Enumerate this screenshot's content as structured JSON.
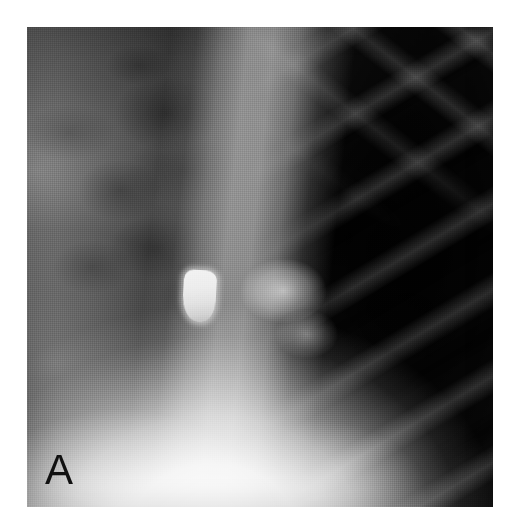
{
  "figure": {
    "type": "radiograph",
    "modality": "chest-x-ray",
    "panel_label": "A",
    "colorspace": "grayscale"
  },
  "canvas": {
    "width": 515,
    "height": 532,
    "background_color": "#ffffff"
  },
  "plate": {
    "x": 27,
    "y": 27,
    "width": 466,
    "height": 480,
    "border_color": "#ffffff"
  },
  "regions": [
    {
      "name": "left-hemithorax-field",
      "description": "mid-gray lung field with mottled pulmonary markings",
      "tone": "#8d8d8d"
    },
    {
      "name": "right-hemithorax-field",
      "description": "dark lucent lung field with diagonal rib shadows",
      "tone": "#242424"
    },
    {
      "name": "mediastinal-band",
      "description": "vertical bright band through the centre of the plate",
      "tone": "#b9b9b9"
    },
    {
      "name": "cardiac-diaphragm-silhouette",
      "description": "very bright opacity occupying the lower centre",
      "tone": "#f0f0f0"
    },
    {
      "name": "hilar-opacity",
      "description": "rounded bright structure right of the dense focus",
      "tone": "#cfcfcf"
    },
    {
      "name": "dense-focus",
      "description": "bright rounded-rectangular high-density opacity",
      "tone": "#eeeeee"
    },
    {
      "name": "rib-shadows",
      "description": "oblique periodic rib bands over the right hemithorax",
      "tone": "#5a5a5a"
    }
  ],
  "annotations": {
    "panel_letter": "A",
    "panel_letter_color": "#111111"
  }
}
